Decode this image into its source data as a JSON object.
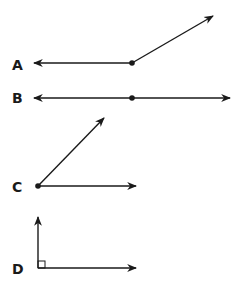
{
  "figures": [
    {
      "label": "A",
      "type": "angle-obtuse",
      "description": "Ray pointing left and ray pointing up-right from a common vertex"
    },
    {
      "label": "B",
      "type": "straight-angle",
      "description": "Line with arrows in both directions and a point in the middle"
    },
    {
      "label": "C",
      "type": "angle-acute",
      "description": "Two rays from a vertex, one horizontal, one up-right"
    },
    {
      "label": "D",
      "type": "angle-right",
      "description": "Two rays forming a right angle with square marker"
    }
  ],
  "colors": {
    "stroke": "#1a1a1a",
    "background": "#ffffff"
  }
}
